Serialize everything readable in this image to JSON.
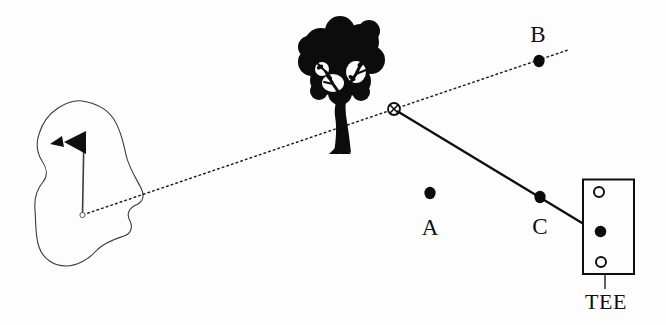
{
  "figure": {
    "type": "golf-course-diagram",
    "background_color": "#fdfdfd",
    "ink_color": "#0f0f0f",
    "outline_color": "#333333",
    "labels": {
      "point_a": "A",
      "point_b": "B",
      "point_c": "C",
      "tee": "TEE"
    },
    "icons": {
      "tree": "tree-silhouette",
      "flag": "golf-flag-pennant",
      "green": "putting-green-outline",
      "intersection": "circled-x-marker",
      "tee_markers": [
        "open-circle",
        "filled-circle",
        "open-circle"
      ]
    },
    "lines": {
      "sight_line": "dashed line from hole through intersection marker past point B",
      "shot_line": "solid line from intersection marker through point C to tee"
    }
  }
}
